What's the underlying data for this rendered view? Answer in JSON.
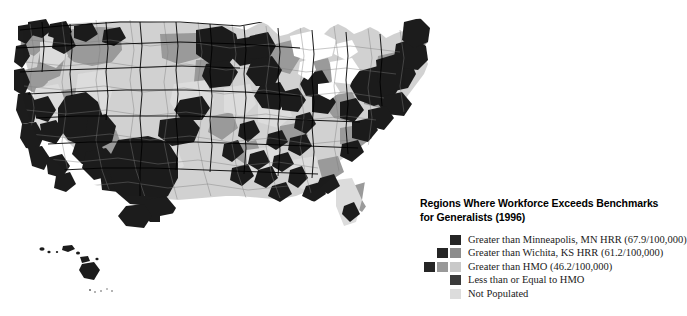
{
  "figure": {
    "background_color": "#ffffff"
  },
  "legend": {
    "title_line_1": "Regions Where Workforce Exceeds Benchmarks",
    "title_line_2": "for Generalists (1996)",
    "title_color": "#000000",
    "items": [
      {
        "label": "Greater than Minneapolis, MN HRR (67.9/100,000)",
        "swatches": [
          "#252525"
        ]
      },
      {
        "label": "Greater than Wichita, KS HRR (61.2/100,000)",
        "swatches": [
          "#252525",
          "#8c8c8c"
        ]
      },
      {
        "label": "Greater than HMO (46.2/100,000)",
        "swatches": [
          "#252525",
          "#999999",
          "#c9c9c9"
        ]
      },
      {
        "label": "Less than or Equal to HMO",
        "swatches": [
          "#3a3a3a"
        ]
      },
      {
        "label": "Not Populated",
        "swatches": [
          "#dcdcdc"
        ]
      }
    ]
  },
  "map_colors": {
    "greater_than_minneapolis": "#1c1c1c",
    "greater_than_wichita": "#8c8c8c",
    "greater_than_hmo": "#c9c9c9",
    "less_than_or_equal_hmo": "#3a3a3a",
    "not_populated": "#e2e2e2",
    "water": "#ffffff",
    "state_border": "#000000",
    "hrr_border": "#6e6e6e"
  },
  "map_regions": {
    "insets": [
      "hawaii"
    ],
    "note_visible_text": ""
  }
}
